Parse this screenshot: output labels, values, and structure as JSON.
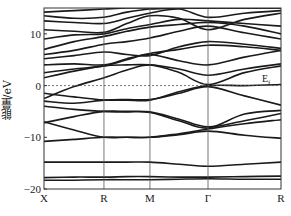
{
  "chart_data": {
    "type": "line",
    "subtype": "band-structure",
    "title": "",
    "ylabel": "能量/eV",
    "xlabel": "",
    "ylim": [
      -20,
      15
    ],
    "yticks": [
      10,
      0,
      -10,
      -20
    ],
    "ytick_labels": [
      "10",
      "0",
      "−10",
      "−20"
    ],
    "kpoints": [
      {
        "label": "X",
        "pos": 0.0
      },
      {
        "label": "R",
        "pos": 0.253
      },
      {
        "label": "M",
        "pos": 0.447
      },
      {
        "label": "Γ",
        "pos": 0.692
      },
      {
        "label": "R",
        "pos": 1.0
      }
    ],
    "fermi_level": {
      "energy": 0,
      "label": "E",
      "subscript": "f",
      "style": "dashed"
    },
    "grid": false,
    "sample_positions": [
      0.0,
      0.127,
      0.253,
      0.35,
      0.447,
      0.57,
      0.692,
      0.846,
      1.0
    ],
    "series": [
      {
        "name": "band1",
        "values": [
          -18.3,
          -18.3,
          -18.2,
          -18.2,
          -18.2,
          -18.1,
          -18.0,
          -18.1,
          -18.1
        ]
      },
      {
        "name": "band2",
        "values": [
          -17.8,
          -17.7,
          -17.7,
          -17.6,
          -17.6,
          -17.7,
          -17.7,
          -17.6,
          -17.5
        ]
      },
      {
        "name": "band3",
        "values": [
          -14.8,
          -14.8,
          -14.8,
          -14.8,
          -14.8,
          -15.2,
          -15.6,
          -15.2,
          -14.8
        ]
      },
      {
        "name": "band4",
        "values": [
          -10.8,
          -10.4,
          -10.0,
          -10.0,
          -10.0,
          -9.5,
          -8.8,
          -9.6,
          -10.2
        ]
      },
      {
        "name": "band5",
        "values": [
          -7.0,
          -8.6,
          -10.0,
          -10.0,
          -10.0,
          -9.3,
          -8.4,
          -7.4,
          -6.6
        ]
      },
      {
        "name": "band6",
        "values": [
          -7.2,
          -6.0,
          -5.0,
          -5.0,
          -5.1,
          -6.5,
          -8.0,
          -6.8,
          -5.4
        ]
      },
      {
        "name": "band7",
        "values": [
          -4.0,
          -4.6,
          -5.0,
          -5.1,
          -5.2,
          -6.8,
          -8.2,
          -5.5,
          -4.8
        ]
      },
      {
        "name": "band8",
        "values": [
          -3.0,
          -3.4,
          -2.8,
          -2.7,
          -2.7,
          -1.5,
          -0.2,
          -2.0,
          -3.8
        ]
      },
      {
        "name": "band9",
        "values": [
          -1.5,
          -2.2,
          -2.8,
          -2.8,
          -2.8,
          -1.2,
          0.0,
          0.0,
          0.2
        ]
      },
      {
        "name": "band10",
        "values": [
          -2.5,
          -0.2,
          1.5,
          3.0,
          4.0,
          2.5,
          0.2,
          2.5,
          3.8
        ]
      },
      {
        "name": "band11",
        "values": [
          1.5,
          2.8,
          3.8,
          4.0,
          4.0,
          3.2,
          2.0,
          3.2,
          4.2
        ]
      },
      {
        "name": "band12",
        "values": [
          2.5,
          3.2,
          3.8,
          5.0,
          6.0,
          4.8,
          4.0,
          5.5,
          6.8
        ]
      },
      {
        "name": "band13",
        "values": [
          4.0,
          4.2,
          4.0,
          5.2,
          6.2,
          7.0,
          7.8,
          7.5,
          6.8
        ]
      },
      {
        "name": "band14",
        "values": [
          5.2,
          5.8,
          6.5,
          6.0,
          5.8,
          7.5,
          8.5,
          8.0,
          7.2
        ]
      },
      {
        "name": "band15",
        "values": [
          6.0,
          6.8,
          8.0,
          8.5,
          9.2,
          10.5,
          11.5,
          10.2,
          9.0
        ]
      },
      {
        "name": "band16",
        "values": [
          7.0,
          8.5,
          9.5,
          10.5,
          11.3,
          11.8,
          12.2,
          11.5,
          10.0
        ]
      },
      {
        "name": "band17",
        "values": [
          9.0,
          9.8,
          10.0,
          11.0,
          11.8,
          12.8,
          12.5,
          12.0,
          11.5
        ]
      },
      {
        "name": "band18",
        "values": [
          10.8,
          10.5,
          10.3,
          12.0,
          13.5,
          13.0,
          10.8,
          12.8,
          14.0
        ]
      },
      {
        "name": "band19",
        "values": [
          12.5,
          12.2,
          12.0,
          13.0,
          14.0,
          14.8,
          13.2,
          14.0,
          14.5
        ]
      },
      {
        "name": "band20",
        "values": [
          13.5,
          13.0,
          13.2,
          14.2,
          14.8,
          15.0,
          15.0,
          15.0,
          15.0
        ]
      },
      {
        "name": "band21",
        "values": [
          14.2,
          14.5,
          14.8,
          15.0,
          15.0,
          15.0,
          15.0,
          15.0,
          15.0
        ]
      }
    ]
  },
  "labels": {
    "ylabel": "能量/eV",
    "ef_main": "E",
    "ef_sub": "f",
    "yt10": "10",
    "yt0": "0",
    "ytm10": "−10",
    "ytm20": "−20",
    "x_X": "X",
    "x_R1": "R",
    "x_M": "M",
    "x_G": "Γ",
    "x_R2": "R"
  }
}
